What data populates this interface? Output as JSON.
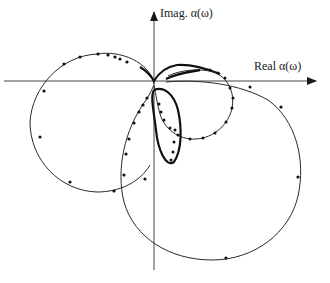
{
  "diagram": {
    "type": "polar-plot",
    "axes": {
      "vertical_label": "Imag. α(ω)",
      "horizontal_label": "Real  α(ω)"
    },
    "curves": [
      {
        "name": "left-circle",
        "description": "circle in left half-plane with dots"
      },
      {
        "name": "small-circle",
        "description": "small circle right of origin, dense dots"
      },
      {
        "name": "large-circle",
        "description": "large circle extending to lower right"
      },
      {
        "name": "inner-loop",
        "description": "small loop near origin, dense dots"
      }
    ],
    "colors": {
      "stroke": "#2a2a2a",
      "background": "#ffffff"
    }
  }
}
